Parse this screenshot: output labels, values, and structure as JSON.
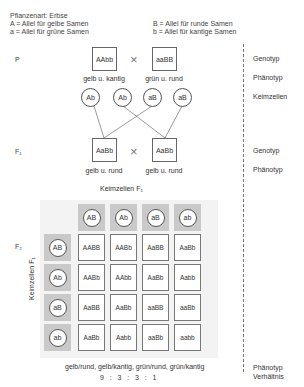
{
  "header": {
    "species": "Pflanzenart: Erbse",
    "alleles": [
      {
        "symbol_text": "A = Allel für gelbe Samen"
      },
      {
        "symbol_text": "a = Allel für grüne Samen"
      },
      {
        "symbol_text": "B = Allel für runde Samen"
      },
      {
        "symbol_text": "b = Allel für kantige Samen"
      }
    ]
  },
  "generations": {
    "p": {
      "label": "P",
      "parents": [
        {
          "genotype": "AAbb",
          "phenotype": "gelb u. kantig"
        },
        {
          "genotype": "aaBB",
          "phenotype": "grün u. rund"
        }
      ],
      "cross_symbol": "×",
      "gametes": [
        "Ab",
        "Ab",
        "aB",
        "aB"
      ]
    },
    "f1": {
      "label": "F₁",
      "parents": [
        {
          "genotype": "AaBb",
          "phenotype": "gelb u. rund"
        },
        {
          "genotype": "AaBb",
          "phenotype": "gelb u. rund"
        }
      ],
      "cross_symbol": "×"
    },
    "f2": {
      "label": "F₂",
      "top_axis_label": "Keimzellen F₁",
      "left_axis_label": "Keimzellen F₁",
      "col_gametes": [
        "AB",
        "Ab",
        "aB",
        "ab"
      ],
      "row_gametes": [
        "AB",
        "Ab",
        "aB",
        "ab"
      ],
      "cells": [
        [
          "AABB",
          "AABb",
          "AaBB",
          "AaBb"
        ],
        [
          "AABb",
          "AAbb",
          "AaBb",
          "Aabb"
        ],
        [
          "AaBB",
          "AaBb",
          "aaBB",
          "aaBb"
        ],
        [
          "AaBb",
          "Aabb",
          "aaBb",
          "aabb"
        ]
      ],
      "phenotypes": "gelb/rund, gelb/kantig, grün/rund, grün/kantig",
      "ratio": "9   :   3   :   3   :   1"
    }
  },
  "side_labels": {
    "genotyp": "Genotyp",
    "phaenotyp": "Phänotyp",
    "keimzellen": "Keimzellen",
    "verhaeltnis": "Verhältnis"
  },
  "colors": {
    "grid_background": "#f3f3f3",
    "header_cell": "#c9c9c9",
    "border": "#666666",
    "text": "#333333"
  }
}
